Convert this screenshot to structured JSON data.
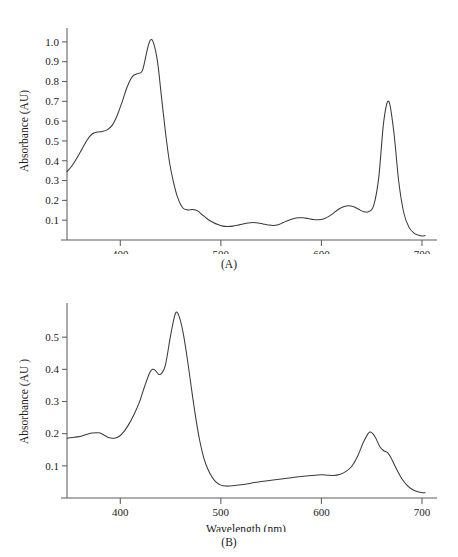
{
  "page": {
    "cropped_header_text": "",
    "background_color": "#ffffff",
    "line_color": "#3a3a3c",
    "axis_color": "#5d5d60"
  },
  "panels": [
    {
      "id": "A",
      "caption": "(A)"
    },
    {
      "id": "B",
      "caption": "(B)"
    }
  ],
  "chart_data": [
    {
      "type": "line",
      "panel": "A",
      "title": "",
      "xlabel": "Wavelength (nm)",
      "ylabel": "Absorbance (AU)",
      "xlim": [
        347,
        703
      ],
      "ylim": [
        0,
        1.06
      ],
      "xticks": [
        400,
        500,
        600,
        700
      ],
      "xtick_labels": [
        "400",
        "500",
        "600",
        "700"
      ],
      "yticks": [
        0.1,
        0.2,
        0.3,
        0.4,
        0.5,
        0.6,
        0.7,
        0.8,
        0.9,
        1.0
      ],
      "ytick_labels": [
        "0.1",
        "0.2",
        "0.3",
        "0.4",
        "0.5",
        "0.6",
        "0.7",
        "0.8",
        "0.9",
        "1.0"
      ],
      "grid": false,
      "legend": "none",
      "annotations": [
        {
          "label": "Soret peak",
          "x": 430,
          "y": 1.01
        },
        {
          "label": "Soret shoulder",
          "x": 410,
          "y": 0.84
        },
        {
          "label": "near-UV shoulder",
          "x": 375,
          "y": 0.545
        },
        {
          "label": "Qy band",
          "x": 662,
          "y": 0.7
        }
      ],
      "x": [
        347,
        352,
        357,
        362,
        367,
        372,
        377,
        382,
        387,
        392,
        397,
        402,
        407,
        412,
        417,
        422,
        427,
        430,
        433,
        437,
        441,
        445,
        449,
        453,
        457,
        462,
        467,
        472,
        477,
        482,
        487,
        492,
        497,
        502,
        507,
        512,
        517,
        522,
        527,
        532,
        537,
        542,
        547,
        552,
        557,
        562,
        567,
        572,
        577,
        582,
        587,
        592,
        597,
        602,
        607,
        612,
        617,
        622,
        627,
        632,
        637,
        642,
        647,
        652,
        657,
        662,
        667,
        672,
        677,
        682,
        687,
        692,
        697,
        700,
        703
      ],
      "y": [
        0.345,
        0.375,
        0.415,
        0.46,
        0.505,
        0.535,
        0.545,
        0.548,
        0.556,
        0.58,
        0.63,
        0.7,
        0.775,
        0.825,
        0.84,
        0.855,
        0.965,
        1.01,
        0.995,
        0.9,
        0.72,
        0.54,
        0.39,
        0.29,
        0.215,
        0.163,
        0.152,
        0.154,
        0.147,
        0.125,
        0.105,
        0.09,
        0.078,
        0.07,
        0.068,
        0.07,
        0.075,
        0.081,
        0.086,
        0.088,
        0.086,
        0.081,
        0.076,
        0.073,
        0.077,
        0.088,
        0.099,
        0.107,
        0.112,
        0.112,
        0.108,
        0.103,
        0.102,
        0.106,
        0.118,
        0.136,
        0.155,
        0.168,
        0.173,
        0.168,
        0.155,
        0.143,
        0.143,
        0.175,
        0.315,
        0.6,
        0.7,
        0.545,
        0.29,
        0.135,
        0.065,
        0.035,
        0.024,
        0.02,
        0.022
      ]
    },
    {
      "type": "line",
      "panel": "B",
      "title": "",
      "xlabel": "Wavelength (nm)",
      "ylabel": "Absorbance (AU )",
      "xlim": [
        347,
        703
      ],
      "ylim": [
        0,
        0.6
      ],
      "xticks": [
        400,
        500,
        600,
        700
      ],
      "xtick_labels": [
        "400",
        "500",
        "600",
        "700"
      ],
      "yticks": [
        0.1,
        0.2,
        0.3,
        0.4,
        0.5
      ],
      "ytick_labels": [
        "0.1",
        "0.2",
        "0.3",
        "0.4",
        "0.5"
      ],
      "grid": false,
      "legend": "none",
      "annotations": [
        {
          "label": "Soret peak",
          "x": 455,
          "y": 0.575
        },
        {
          "label": "Soret shoulder",
          "x": 432,
          "y": 0.4
        },
        {
          "label": "near-UV bump",
          "x": 380,
          "y": 0.203
        },
        {
          "label": "Qy band",
          "x": 648,
          "y": 0.205
        },
        {
          "label": "Qy shoulder",
          "x": 662,
          "y": 0.147
        }
      ],
      "x": [
        347,
        352,
        357,
        362,
        367,
        372,
        377,
        380,
        384,
        389,
        394,
        399,
        404,
        409,
        414,
        419,
        424,
        429,
        432,
        435,
        438,
        441,
        445,
        450,
        455,
        459,
        463,
        467,
        471,
        475,
        479,
        483,
        487,
        491,
        495,
        500,
        505,
        512,
        520,
        530,
        540,
        550,
        560,
        570,
        580,
        590,
        600,
        606,
        612,
        618,
        624,
        630,
        636,
        642,
        648,
        653,
        658,
        662,
        666,
        670,
        675,
        680,
        685,
        690,
        695,
        700,
        703
      ],
      "y": [
        0.186,
        0.188,
        0.19,
        0.193,
        0.198,
        0.202,
        0.203,
        0.202,
        0.195,
        0.187,
        0.186,
        0.192,
        0.208,
        0.232,
        0.262,
        0.298,
        0.345,
        0.388,
        0.4,
        0.396,
        0.385,
        0.387,
        0.415,
        0.505,
        0.575,
        0.56,
        0.505,
        0.425,
        0.335,
        0.25,
        0.178,
        0.125,
        0.09,
        0.066,
        0.05,
        0.04,
        0.037,
        0.038,
        0.041,
        0.046,
        0.051,
        0.055,
        0.059,
        0.063,
        0.067,
        0.07,
        0.072,
        0.071,
        0.07,
        0.073,
        0.082,
        0.098,
        0.13,
        0.175,
        0.205,
        0.192,
        0.16,
        0.147,
        0.14,
        0.12,
        0.088,
        0.06,
        0.04,
        0.027,
        0.02,
        0.017,
        0.016
      ]
    }
  ]
}
